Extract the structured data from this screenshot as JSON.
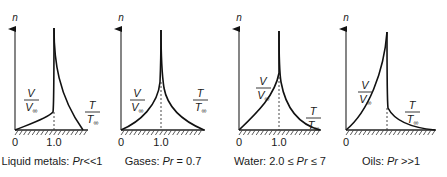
{
  "figure": {
    "axis_label": "n",
    "tick_zero": "0",
    "tick_one": "1.0",
    "velocity_label": {
      "num": "V",
      "den": "V",
      "sub": "∞"
    },
    "temperature_label": {
      "num": "T",
      "den": "T",
      "sub": "∞"
    },
    "panels": [
      {
        "id": "liquid-metals",
        "caption_prefix": "Liquid metals: ",
        "caption_pr": "Pr",
        "caption_suffix": "<<1",
        "show_tick_one": true,
        "origin_x": 15,
        "one_x": 54,
        "v_path": "M15,130 C30,124 48,118 53,112 C54,105 54,60 54,28",
        "t_path": "M54,28 C54,60 58,95 83,130",
        "dash_top": 112,
        "wall_end": 88,
        "v_label": {
          "x": 24,
          "y": 100
        },
        "t_label": {
          "x": 85,
          "y": 112
        }
      },
      {
        "id": "gases",
        "caption_prefix": "Gases: ",
        "caption_pr": "Pr",
        "caption_suffix": " = 0.7",
        "show_tick_one": true,
        "origin_x": 121,
        "one_x": 161,
        "v_path": "M121,130 C140,122 158,105 160,82 C161,60 161,45 161,30",
        "t_path": "M161,30 C161,55 162,75 164,88 C168,110 185,122 204,130",
        "dash_top": 82,
        "wall_end": 205,
        "v_label": {
          "x": 130,
          "y": 100
        },
        "t_label": {
          "x": 193,
          "y": 100
        }
      },
      {
        "id": "water",
        "caption_prefix": "Water: 2.0 ≤ ",
        "caption_pr": "Pr",
        "caption_suffix": " ≤ 7",
        "show_tick_one": true,
        "origin_x": 239,
        "one_x": 279,
        "v_path": "M239,130 C258,112 275,95 279,73 C279,60 279,45 279,31",
        "t_path": "M279,31 C279,55 279,70 281,82 C287,115 305,126 320,130",
        "dash_top": 73,
        "wall_end": 321,
        "v_label": {
          "x": 256,
          "y": 88
        },
        "t_label": {
          "x": 306,
          "y": 118
        }
      },
      {
        "id": "oils",
        "caption_prefix": "Oils: ",
        "caption_pr": "Pr",
        "caption_suffix": " >>1",
        "show_tick_one": false,
        "origin_x": 346,
        "one_x": 387,
        "v_path": "M346,130 C368,112 384,72 387,32",
        "t_path": "M387,32 C387,60 387,100 388,108 C395,122 415,128 435,130",
        "dash_top": 108,
        "wall_end": 436,
        "v_label": {
          "x": 358,
          "y": 92
        },
        "t_label": {
          "x": 405,
          "y": 112
        }
      }
    ]
  },
  "colors": {
    "ink": "#111111",
    "background": "#ffffff"
  }
}
